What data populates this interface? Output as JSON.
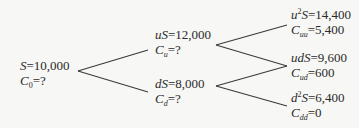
{
  "diagram": {
    "type": "binomial-tree",
    "line_color": "#3a3a3a",
    "nodes": {
      "root": {
        "price_label": "S",
        "price_value": "10,000",
        "option_label": "C",
        "option_sub": "0",
        "option_value": "?"
      },
      "up": {
        "price_label": "uS",
        "price_value": "12,000",
        "option_label": "C",
        "option_sub": "u",
        "option_value": "?"
      },
      "down": {
        "price_label": "dS",
        "price_value": "8,000",
        "option_label": "C",
        "option_sub": "d",
        "option_value": "?"
      },
      "upup": {
        "price_label_pre": "u",
        "price_sup": "2",
        "price_label_post": "S",
        "price_value": "14,400",
        "option_label": "C",
        "option_sub": "uu",
        "option_value": "5,400"
      },
      "updown": {
        "price_label": "udS",
        "price_value": "9,600",
        "option_label": "C",
        "option_sub": "ud",
        "option_value": "600"
      },
      "downdown": {
        "price_label_pre": "d",
        "price_sup": "2",
        "price_label_post": "S",
        "price_value": "6,400",
        "option_label": "C",
        "option_sub": "dd",
        "option_value": "0"
      }
    },
    "edges": [
      {
        "from": "root",
        "to": "up"
      },
      {
        "from": "root",
        "to": "down"
      },
      {
        "from": "up",
        "to": "upup"
      },
      {
        "from": "up",
        "to": "updown"
      },
      {
        "from": "down",
        "to": "updown"
      },
      {
        "from": "down",
        "to": "downdown"
      }
    ],
    "equals": "="
  }
}
